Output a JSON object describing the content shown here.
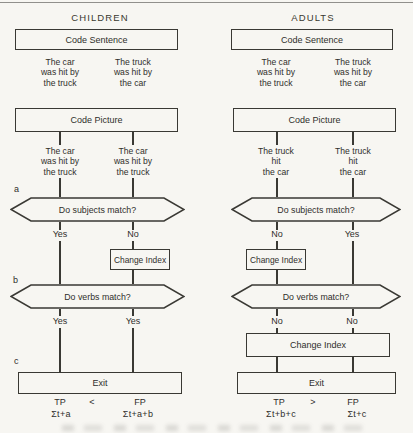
{
  "figure": {
    "margin_letters": [
      "a",
      "b",
      "c"
    ],
    "columns": [
      {
        "id": "children",
        "title": "CHILDREN",
        "code_sentence_label": "Code Sentence",
        "sentence_stimuli": [
          "The car\nwas hit by\nthe truck",
          "The truck\nwas hit by\nthe car"
        ],
        "code_picture_label": "Code Picture",
        "picture_stimuli": [
          "The car\nwas hit by\nthe truck",
          "The car\nwas hit by\nthe truck"
        ],
        "subjects_question": "Do subjects match?",
        "subjects_answers": [
          "Yes",
          "No"
        ],
        "subjects_change_index_label": "Change Index",
        "verbs_question": "Do verbs match?",
        "verbs_answers": [
          "Yes",
          "Yes"
        ],
        "exit_label": "Exit",
        "totals": {
          "tp_label": "TP",
          "comparator": "<",
          "fp_label": "FP",
          "tp_formula": "Σt+a",
          "fp_formula": "Σt+a+b"
        }
      },
      {
        "id": "adults",
        "title": "ADULTS",
        "code_sentence_label": "Code Sentence",
        "sentence_stimuli": [
          "The car\nwas hit by\nthe truck",
          "The truck\nwas hit by\nthe car"
        ],
        "code_picture_label": "Code Picture",
        "picture_stimuli": [
          "The truck\nhit\nthe car",
          "The truck\nhit\nthe car"
        ],
        "subjects_question": "Do subjects match?",
        "subjects_answers": [
          "No",
          "Yes"
        ],
        "subjects_change_index_label": "Change Index",
        "verbs_question": "Do verbs match?",
        "verbs_answers": [
          "No",
          "No"
        ],
        "verbs_change_index_label": "Change Index",
        "exit_label": "Exit",
        "totals": {
          "tp_label": "TP",
          "comparator": ">",
          "fp_label": "FP",
          "tp_formula": "Σt+b+c",
          "fp_formula": "Σt+c"
        }
      }
    ]
  }
}
